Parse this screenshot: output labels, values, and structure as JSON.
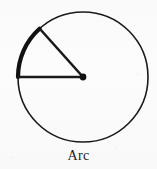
{
  "figure": {
    "caption": "Arc",
    "canvas": {
      "width": 157,
      "height": 169,
      "background_color": "#fbfbfb"
    },
    "stroke_color": "#1a1a1a",
    "circle": {
      "name": "circle-outline",
      "center_x": 83,
      "center_y": 77,
      "radius": 65,
      "stroke_width": 1.6,
      "fill": "none"
    },
    "highlighted_arc": {
      "name": "highlighted-arc",
      "start_angle_deg": 132,
      "end_angle_deg": 180,
      "sweep_deg": 48,
      "stroke_width": 4.2,
      "color": "#111111",
      "start_point_x": 40,
      "start_point_y": 29,
      "end_point_x": 18,
      "end_point_y": 77
    },
    "radii": [
      {
        "name": "radius-horizontal",
        "from_x": 83,
        "from_y": 77,
        "to_x": 18,
        "to_y": 77,
        "angle_deg": 180,
        "stroke_width": 2.6
      },
      {
        "name": "radius-diagonal",
        "from_x": 83,
        "from_y": 77,
        "to_x": 40,
        "to_y": 29,
        "angle_deg": 132,
        "stroke_width": 2.6
      }
    ],
    "center_point": {
      "name": "center-point",
      "x": 83,
      "y": 77,
      "radius": 3.4,
      "fill": "#111111"
    }
  }
}
